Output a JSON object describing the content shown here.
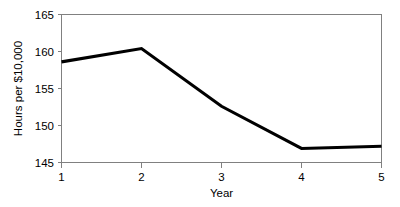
{
  "chart_data": {
    "type": "line",
    "title": "",
    "subtitle": "",
    "xlabel": "Year",
    "ylabel": "Hours per $10,000",
    "x": [
      1,
      2,
      3,
      4,
      5
    ],
    "values": [
      158.6,
      160.4,
      152.6,
      146.9,
      147.2
    ],
    "series": [
      {
        "name": "Hours per $10,000",
        "values": [
          158.6,
          160.4,
          152.6,
          146.9,
          147.2
        ],
        "color": "#000000"
      }
    ],
    "xlim": [
      1,
      5
    ],
    "ylim": [
      145,
      165
    ],
    "xticks": [
      1,
      2,
      3,
      4,
      5
    ],
    "yticks": [
      145,
      150,
      155,
      160,
      165
    ],
    "xtick_labels": [
      "1",
      "2",
      "3",
      "4",
      "5"
    ],
    "ytick_labels": [
      "145",
      "150",
      "155",
      "160",
      "165"
    ],
    "grid": false,
    "legend": false,
    "legend_position": "none",
    "markers": false,
    "frame": true,
    "annotations": [],
    "colors": {
      "line": "#000000",
      "frame": "#808080",
      "background": "#ffffff",
      "text": "#000000"
    }
  }
}
